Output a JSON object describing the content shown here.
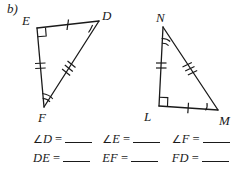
{
  "problem": {
    "part_label": "b)"
  },
  "ink_color": "#1a1a1a",
  "figures": [
    {
      "name": "triangle-edf",
      "vertices": [
        {
          "label": "E",
          "role": "right-angle",
          "marks": "right-angle-square"
        },
        {
          "label": "D",
          "role": "angle",
          "marks": "single-arc"
        },
        {
          "label": "F",
          "role": "angle",
          "marks": "double-arc"
        }
      ],
      "sides": [
        {
          "from": "E",
          "to": "D",
          "ticks": 1
        },
        {
          "from": "E",
          "to": "F",
          "ticks": 2
        },
        {
          "from": "D",
          "to": "F",
          "ticks": 3
        }
      ]
    },
    {
      "name": "triangle-nlm",
      "vertices": [
        {
          "label": "N",
          "role": "angle",
          "marks": "double-arc"
        },
        {
          "label": "L",
          "role": "right-angle",
          "marks": "right-angle-square"
        },
        {
          "label": "M",
          "role": "angle",
          "marks": "single-arc"
        }
      ],
      "sides": [
        {
          "from": "N",
          "to": "L",
          "ticks": 2
        },
        {
          "from": "N",
          "to": "M",
          "ticks": 3
        },
        {
          "from": "L",
          "to": "M",
          "ticks": 1
        }
      ]
    }
  ],
  "answers": {
    "equals": "=",
    "angle_symbol": "∠",
    "rows": [
      {
        "row_name": "angle-row",
        "cells": [
          {
            "prefix": "∠",
            "term": "D",
            "equals": "="
          },
          {
            "prefix": "∠",
            "term": "E",
            "equals": "="
          },
          {
            "prefix": "∠",
            "term": "F",
            "equals": "="
          }
        ]
      },
      {
        "row_name": "length-row",
        "cells": [
          {
            "prefix": "",
            "term": "DE",
            "equals": "="
          },
          {
            "prefix": "",
            "term": "EF",
            "equals": "="
          },
          {
            "prefix": "",
            "term": "FD",
            "equals": "="
          }
        ]
      }
    ]
  }
}
